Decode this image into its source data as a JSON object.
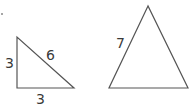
{
  "diagram": {
    "triangles": [
      {
        "name": "right-triangle",
        "type": "right",
        "sides": {
          "left": "3",
          "hypotenuse": "6",
          "bottom": "3"
        }
      },
      {
        "name": "isosceles-triangle",
        "type": "isosceles",
        "sides": {
          "left": "7"
        }
      }
    ]
  }
}
